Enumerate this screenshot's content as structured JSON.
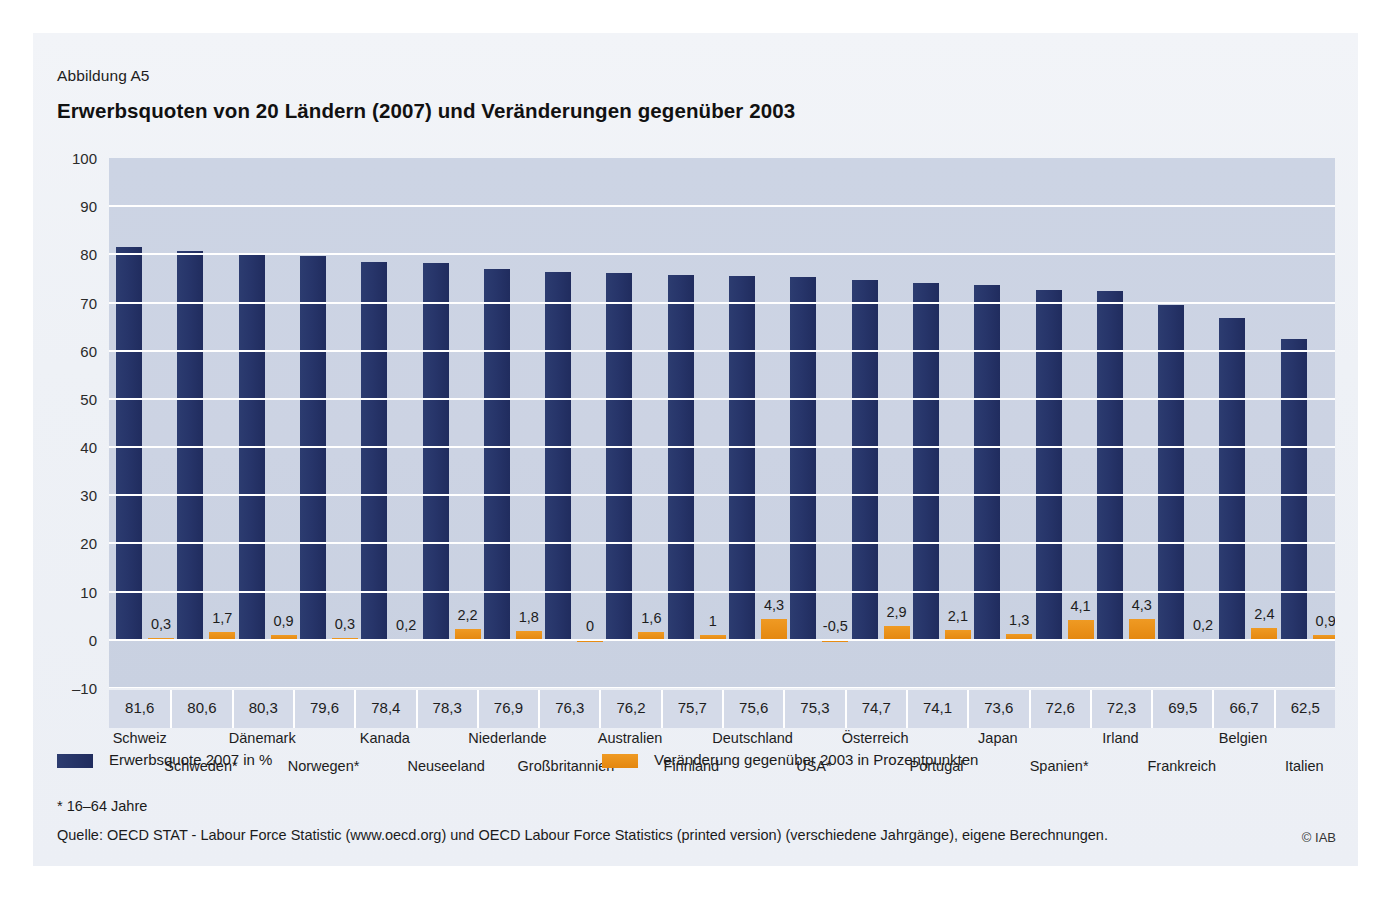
{
  "figure": {
    "number": "Abbildung A5",
    "title": "Erwerbsquoten von 20 Ländern (2007) und Veränderungen gegenüber 2003"
  },
  "legend": {
    "items": [
      {
        "label": "Erwerbsquote 2007 in %",
        "color": "#27356a"
      },
      {
        "label": "Veränderung gegenüber 2003 in Prozentpunkten",
        "color": "#e4870f"
      }
    ]
  },
  "footnotes": {
    "star": "* 16–64 Jahre",
    "source": "Quelle: OECD STAT - Labour Force Statistic (www.oecd.org) und OECD Labour Force Statistics (printed version) (verschiedene Jahrgänge), eigene Berechnungen.",
    "copyright": "© IAB"
  },
  "chart_data": {
    "type": "bar",
    "title": "Erwerbsquoten von 20 Ländern (2007) und Veränderungen gegenüber 2003",
    "xlabel": "",
    "ylabel": "",
    "ylim": [
      -10,
      100
    ],
    "yticks": [
      100,
      90,
      80,
      70,
      60,
      50,
      40,
      30,
      20,
      10,
      0,
      -10
    ],
    "grid": true,
    "legend_position": "bottom-left",
    "categories": [
      "Schweiz",
      "Schweden*",
      "Dänemark",
      "Norwegen*",
      "Kanada",
      "Neuseeland",
      "Niederlande",
      "Großbritannien*",
      "Australien",
      "Finnland",
      "Deutschland",
      "USA*",
      "Österreich",
      "Portugal",
      "Japan",
      "Spanien*",
      "Irland",
      "Frankreich",
      "Belgien",
      "Italien"
    ],
    "series": [
      {
        "name": "Erwerbsquote 2007 in %",
        "color": "#27356a",
        "values": [
          81.6,
          80.6,
          80.3,
          79.6,
          78.4,
          78.3,
          76.9,
          76.3,
          76.2,
          75.7,
          75.6,
          75.3,
          74.7,
          74.1,
          73.6,
          72.6,
          72.3,
          69.5,
          66.7,
          62.5
        ],
        "labels": [
          "81,6",
          "80,6",
          "80,3",
          "79,6",
          "78,4",
          "78,3",
          "76,9",
          "76,3",
          "76,2",
          "75,7",
          "75,6",
          "75,3",
          "74,7",
          "74,1",
          "73,6",
          "72,6",
          "72,3",
          "69,5",
          "66,7",
          "62,5"
        ]
      },
      {
        "name": "Veränderung gegenüber 2003 in Prozentpunkten",
        "color": "#e4870f",
        "values": [
          0.3,
          1.7,
          0.9,
          0.3,
          0.2,
          2.2,
          1.8,
          0,
          1.6,
          1,
          4.3,
          -0.5,
          2.9,
          2.1,
          1.3,
          4.1,
          4.3,
          0.2,
          2.4,
          0.9
        ],
        "labels": [
          "0,3",
          "1,7",
          "0,9",
          "0,3",
          "0,2",
          "2,2",
          "1,8",
          "0",
          "1,6",
          "1",
          "4,3",
          "-0,5",
          "2,9",
          "2,1",
          "1,3",
          "4,1",
          "4,3",
          "0,2",
          "2,4",
          "0,9"
        ]
      }
    ]
  }
}
